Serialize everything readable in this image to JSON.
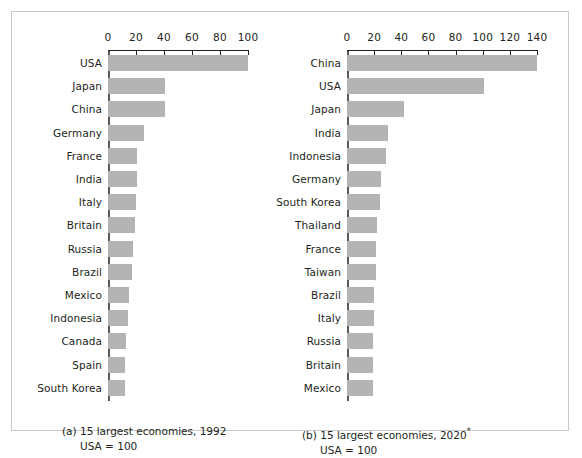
{
  "figure": {
    "panels": [
      {
        "id": "panel-a",
        "caption_main": "(a) 15 largest economies, 1992",
        "caption_sub": "USA = 100",
        "axis": {
          "ticks": [
            0,
            20,
            40,
            60,
            80,
            100
          ],
          "min": 0,
          "max": 100
        },
        "bars": [
          {
            "label": "USA",
            "value": 100
          },
          {
            "label": "Japan",
            "value": 41
          },
          {
            "label": "China",
            "value": 41
          },
          {
            "label": "Germany",
            "value": 26
          },
          {
            "label": "France",
            "value": 21
          },
          {
            "label": "India",
            "value": 21
          },
          {
            "label": "Italy",
            "value": 20
          },
          {
            "label": "Britain",
            "value": 19
          },
          {
            "label": "Russia",
            "value": 18
          },
          {
            "label": "Brazil",
            "value": 17
          },
          {
            "label": "Mexico",
            "value": 15
          },
          {
            "label": "Indonesia",
            "value": 14
          },
          {
            "label": "Canada",
            "value": 13
          },
          {
            "label": "Spain",
            "value": 12
          },
          {
            "label": "South Korea",
            "value": 12
          }
        ]
      },
      {
        "id": "panel-b",
        "caption_main": "(b) 15 largest economies, 2020",
        "caption_star": "*",
        "caption_sub": "USA = 100",
        "axis": {
          "ticks": [
            0,
            20,
            40,
            60,
            80,
            100,
            120,
            140
          ],
          "min": 0,
          "max": 140
        },
        "bars": [
          {
            "label": "China",
            "value": 140
          },
          {
            "label": "USA",
            "value": 101
          },
          {
            "label": "Japan",
            "value": 42
          },
          {
            "label": "India",
            "value": 30
          },
          {
            "label": "Indonesia",
            "value": 29
          },
          {
            "label": "Germany",
            "value": 25
          },
          {
            "label": "South Korea",
            "value": 24
          },
          {
            "label": "Thailand",
            "value": 22
          },
          {
            "label": "France",
            "value": 21
          },
          {
            "label": "Taiwan",
            "value": 21
          },
          {
            "label": "Brazil",
            "value": 20
          },
          {
            "label": "Italy",
            "value": 20
          },
          {
            "label": "Russia",
            "value": 19
          },
          {
            "label": "Britain",
            "value": 19
          },
          {
            "label": "Mexico",
            "value": 19
          }
        ]
      }
    ]
  },
  "chart_data": [
    {
      "type": "bar",
      "title": "(a) 15 largest economies, 1992",
      "subtitle": "USA = 100",
      "orientation": "horizontal",
      "categories": [
        "USA",
        "Japan",
        "China",
        "Germany",
        "France",
        "India",
        "Italy",
        "Britain",
        "Russia",
        "Brazil",
        "Mexico",
        "Indonesia",
        "Canada",
        "Spain",
        "South Korea"
      ],
      "values": [
        100,
        41,
        41,
        26,
        21,
        21,
        20,
        19,
        18,
        17,
        15,
        14,
        13,
        12,
        12
      ],
      "xlabel": "",
      "ylabel": "",
      "xlim": [
        0,
        100
      ],
      "xticks": [
        0,
        20,
        40,
        60,
        80,
        100
      ],
      "grid": false,
      "legend": "none",
      "bar_color": "#b4b4b4"
    },
    {
      "type": "bar",
      "title": "(b) 15 largest economies, 2020*",
      "subtitle": "USA = 100",
      "orientation": "horizontal",
      "categories": [
        "China",
        "USA",
        "Japan",
        "India",
        "Indonesia",
        "Germany",
        "South Korea",
        "Thailand",
        "France",
        "Taiwan",
        "Brazil",
        "Italy",
        "Russia",
        "Britain",
        "Mexico"
      ],
      "values": [
        140,
        101,
        42,
        30,
        29,
        25,
        24,
        22,
        21,
        21,
        20,
        20,
        19,
        19,
        19
      ],
      "xlabel": "",
      "ylabel": "",
      "xlim": [
        0,
        140
      ],
      "xticks": [
        0,
        20,
        40,
        60,
        80,
        100,
        120,
        140
      ],
      "grid": false,
      "legend": "none",
      "bar_color": "#b4b4b4"
    }
  ]
}
